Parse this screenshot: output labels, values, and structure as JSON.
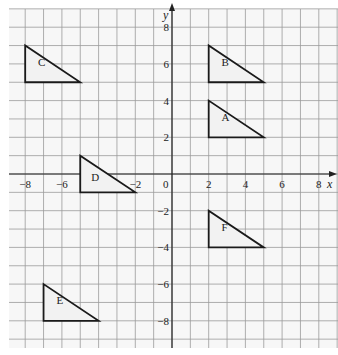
{
  "diagram": {
    "type": "coordinate-grid",
    "axes": {
      "x_label": "x",
      "y_label": "y",
      "x_range": [
        -9,
        9
      ],
      "y_range": [
        -9,
        9
      ],
      "x_ticks": [
        {
          "value": -8,
          "label": "−8"
        },
        {
          "value": -6,
          "label": "−6"
        },
        {
          "value": -4,
          "label": "−4"
        },
        {
          "value": -2,
          "label": "−2"
        },
        {
          "value": 2,
          "label": "2"
        },
        {
          "value": 4,
          "label": "4"
        },
        {
          "value": 6,
          "label": "6"
        },
        {
          "value": 8,
          "label": "8"
        }
      ],
      "y_ticks": [
        {
          "value": 8,
          "label": "8"
        },
        {
          "value": 6,
          "label": "6"
        },
        {
          "value": 4,
          "label": "4"
        },
        {
          "value": 2,
          "label": "2"
        },
        {
          "value": -2,
          "label": "−2"
        },
        {
          "value": -4,
          "label": "−4"
        },
        {
          "value": -6,
          "label": "−6"
        },
        {
          "value": -8,
          "label": "−8"
        }
      ],
      "origin_label": "0"
    },
    "triangles": [
      {
        "name": "A",
        "vertices": [
          [
            2,
            2
          ],
          [
            2,
            4
          ],
          [
            5,
            2
          ]
        ],
        "label_pos": [
          2.7,
          2.9
        ]
      },
      {
        "name": "B",
        "vertices": [
          [
            2,
            5
          ],
          [
            2,
            7
          ],
          [
            5,
            5
          ]
        ],
        "label_pos": [
          2.7,
          5.9
        ]
      },
      {
        "name": "C",
        "vertices": [
          [
            -8,
            5
          ],
          [
            -8,
            7
          ],
          [
            -5,
            5
          ]
        ],
        "label_pos": [
          -7.3,
          5.9
        ]
      },
      {
        "name": "D",
        "vertices": [
          [
            -5,
            -1
          ],
          [
            -5,
            1
          ],
          [
            -2,
            -1
          ]
        ],
        "label_pos": [
          -4.4,
          -0.4
        ]
      },
      {
        "name": "E",
        "vertices": [
          [
            -7,
            -8
          ],
          [
            -7,
            -6
          ],
          [
            -4,
            -8
          ]
        ],
        "label_pos": [
          -6.3,
          -7.1
        ]
      },
      {
        "name": "F",
        "vertices": [
          [
            2,
            -4
          ],
          [
            2,
            -2
          ],
          [
            5,
            -4
          ]
        ],
        "label_pos": [
          2.7,
          -3.1
        ]
      }
    ],
    "colors": {
      "grid": "#9a9a9a",
      "axis": "#222222",
      "shape_stroke": "#1a1a1a",
      "shape_fill": "#f2f2f2",
      "background": "#f7f7f7"
    }
  }
}
